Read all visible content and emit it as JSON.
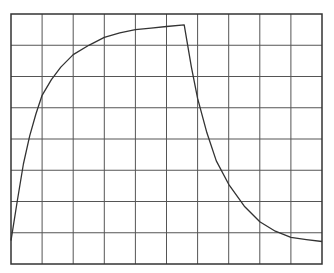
{
  "chart_data": {
    "type": "line",
    "title": "",
    "xlabel": "",
    "ylabel": "",
    "grid": true,
    "grid_divisions": {
      "x": 10,
      "y": 8
    },
    "xlim": [
      0,
      10
    ],
    "ylim": [
      0,
      8
    ],
    "series": [
      {
        "name": "response",
        "color": "#333333",
        "points": [
          [
            0.0,
            0.75
          ],
          [
            0.2,
            2.0
          ],
          [
            0.4,
            3.2
          ],
          [
            0.6,
            4.1
          ],
          [
            0.8,
            4.8
          ],
          [
            1.0,
            5.4
          ],
          [
            1.3,
            5.9
          ],
          [
            1.6,
            6.3
          ],
          [
            2.0,
            6.7
          ],
          [
            2.5,
            7.0
          ],
          [
            3.0,
            7.25
          ],
          [
            3.5,
            7.4
          ],
          [
            4.0,
            7.5
          ],
          [
            4.5,
            7.55
          ],
          [
            5.0,
            7.6
          ],
          [
            5.57,
            7.65
          ],
          [
            5.8,
            6.3
          ],
          [
            6.0,
            5.3
          ],
          [
            6.3,
            4.2
          ],
          [
            6.6,
            3.3
          ],
          [
            7.0,
            2.55
          ],
          [
            7.5,
            1.85
          ],
          [
            8.0,
            1.35
          ],
          [
            8.5,
            1.05
          ],
          [
            9.0,
            0.85
          ],
          [
            9.5,
            0.78
          ],
          [
            10.0,
            0.72
          ]
        ]
      }
    ]
  },
  "colors": {
    "grid": "#555555",
    "frame": "#333333",
    "line": "#333333",
    "background": "#ffffff"
  }
}
